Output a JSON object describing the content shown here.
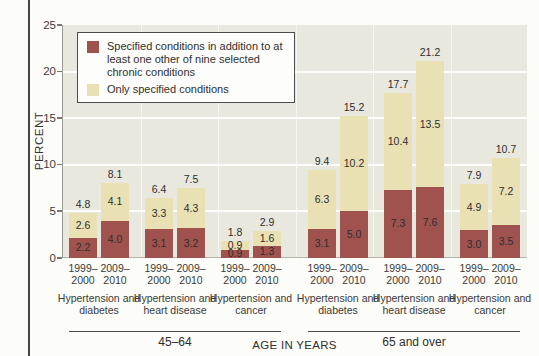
{
  "colors": {
    "page_bg": "#fcfcf9",
    "left_rule": "#454545",
    "plot_bg": "#e8e8df",
    "grid": "#ffffff",
    "dark_segment": "#a0524e",
    "light_segment": "#e9e1b4",
    "text": "#3a3a3a",
    "legend_border": "#4c4c4c",
    "axis": "#9a9a94"
  },
  "chart_data": {
    "type": "bar",
    "stacked": true,
    "title": "",
    "xlabel": "AGE IN YEARS",
    "ylabel": "PERCENT",
    "ylim": [
      0,
      25
    ],
    "yticks": [
      0,
      5,
      10,
      15,
      20,
      25
    ],
    "grid": true,
    "legend_position": "top-left",
    "legend": [
      {
        "key": "dark",
        "label": "Specified conditions in addition to at least one other of nine selected chronic conditions",
        "color": "#a0524e"
      },
      {
        "key": "light",
        "label": "Only specified conditions",
        "color": "#e9e1b4"
      }
    ],
    "groups": [
      {
        "label": "45–64",
        "conditions": [
          {
            "label": "Hypertension and diabetes",
            "bars": [
              {
                "period": "1999–2000",
                "dark": 2.2,
                "light": 2.6,
                "total": 4.8
              },
              {
                "period": "2009–2010",
                "dark": 4.0,
                "light": 4.1,
                "total": 8.1
              }
            ]
          },
          {
            "label": "Hypertension and heart disease",
            "bars": [
              {
                "period": "1999–2000",
                "dark": 3.1,
                "light": 3.3,
                "total": 6.4
              },
              {
                "period": "2009–2010",
                "dark": 3.2,
                "light": 4.3,
                "total": 7.5
              }
            ]
          },
          {
            "label": "Hypertension and cancer",
            "bars": [
              {
                "period": "1999–2000",
                "dark": 0.9,
                "light": 0.9,
                "total": 1.8
              },
              {
                "period": "2009–2010",
                "dark": 1.3,
                "light": 1.6,
                "total": 2.9
              }
            ]
          }
        ]
      },
      {
        "label": "65 and over",
        "conditions": [
          {
            "label": "Hypertension and diabetes",
            "bars": [
              {
                "period": "1999–2000",
                "dark": 3.1,
                "light": 6.3,
                "total": 9.4
              },
              {
                "period": "2009–2010",
                "dark": 5.0,
                "light": 10.2,
                "total": 15.2
              }
            ]
          },
          {
            "label": "Hypertension and heart disease",
            "bars": [
              {
                "period": "1999–2000",
                "dark": 7.3,
                "light": 10.4,
                "total": 17.7
              },
              {
                "period": "2009–2010",
                "dark": 7.6,
                "light": 13.5,
                "total": 21.2
              }
            ]
          },
          {
            "label": "Hypertension and cancer",
            "bars": [
              {
                "period": "1999–2000",
                "dark": 3.0,
                "light": 4.9,
                "total": 7.9
              },
              {
                "period": "2009–2010",
                "dark": 3.5,
                "light": 7.2,
                "total": 10.7
              }
            ]
          }
        ]
      }
    ]
  }
}
